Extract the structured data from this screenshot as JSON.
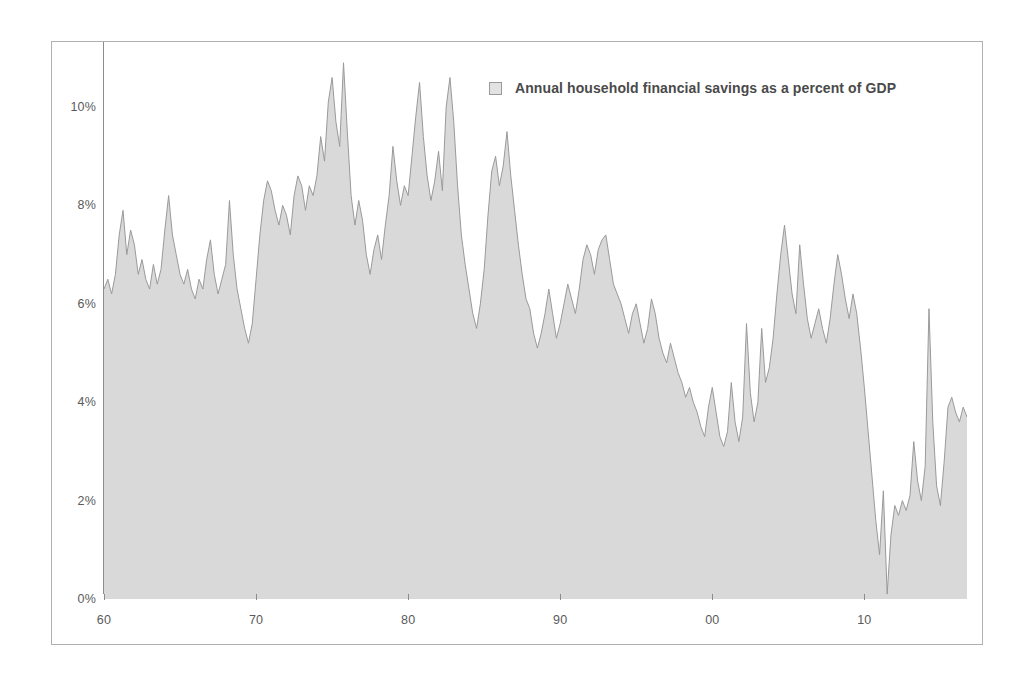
{
  "chart_data": {
    "type": "area",
    "title": "",
    "subtitle": "",
    "xlabel": "",
    "ylabel": "",
    "xlim": [
      1960,
      2016.75
    ],
    "ylim": [
      0,
      11.2
    ],
    "grid": false,
    "legend_position": "top-center-right",
    "legend": [
      {
        "name": "Annual household financial savings as a percent of GDP",
        "swatch_color": "#e2e2e2",
        "line_color": "#9a9a9a"
      }
    ],
    "y_ticks": [
      {
        "value": 0,
        "label": "0%"
      },
      {
        "value": 2,
        "label": "2%"
      },
      {
        "value": 4,
        "label": "4%"
      },
      {
        "value": 6,
        "label": "6%"
      },
      {
        "value": 8,
        "label": "8%"
      },
      {
        "value": 10,
        "label": "10%"
      }
    ],
    "x_ticks": [
      {
        "value": 1960,
        "label": "60"
      },
      {
        "value": 1970,
        "label": "70"
      },
      {
        "value": 1980,
        "label": "80"
      },
      {
        "value": 1990,
        "label": "90"
      },
      {
        "value": 2000,
        "label": "00"
      },
      {
        "value": 2010,
        "label": "10"
      }
    ],
    "series": [
      {
        "name": "Annual household financial savings as a percent of GDP",
        "x_start": 1960.0,
        "x_step": 0.25,
        "unit": "percent of GDP",
        "values": [
          6.3,
          6.5,
          6.2,
          6.6,
          7.4,
          7.9,
          7.0,
          7.5,
          7.2,
          6.6,
          6.9,
          6.5,
          6.3,
          6.8,
          6.4,
          6.7,
          7.5,
          8.2,
          7.4,
          7.0,
          6.6,
          6.4,
          6.7,
          6.3,
          6.1,
          6.5,
          6.3,
          6.9,
          7.3,
          6.6,
          6.2,
          6.5,
          6.8,
          8.1,
          7.0,
          6.3,
          5.9,
          5.5,
          5.2,
          5.6,
          6.5,
          7.4,
          8.1,
          8.5,
          8.3,
          7.9,
          7.6,
          8.0,
          7.8,
          7.4,
          8.2,
          8.6,
          8.4,
          7.9,
          8.4,
          8.2,
          8.6,
          9.4,
          8.9,
          10.1,
          10.6,
          9.7,
          9.2,
          10.9,
          9.5,
          8.2,
          7.6,
          8.1,
          7.7,
          7.0,
          6.6,
          7.1,
          7.4,
          6.9,
          7.6,
          8.2,
          9.2,
          8.5,
          8.0,
          8.4,
          8.2,
          9.0,
          9.8,
          10.5,
          9.4,
          8.6,
          8.1,
          8.5,
          9.1,
          8.3,
          10.0,
          10.6,
          9.7,
          8.4,
          7.4,
          6.8,
          6.3,
          5.8,
          5.5,
          6.0,
          6.7,
          7.8,
          8.7,
          9.0,
          8.4,
          8.8,
          9.5,
          8.6,
          7.9,
          7.2,
          6.6,
          6.1,
          5.9,
          5.4,
          5.1,
          5.4,
          5.8,
          6.3,
          5.8,
          5.3,
          5.6,
          6.0,
          6.4,
          6.1,
          5.8,
          6.3,
          6.9,
          7.2,
          7.0,
          6.6,
          7.1,
          7.3,
          7.4,
          6.9,
          6.4,
          6.2,
          6.0,
          5.7,
          5.4,
          5.8,
          6.0,
          5.6,
          5.2,
          5.5,
          6.1,
          5.8,
          5.3,
          5.0,
          4.8,
          5.2,
          4.9,
          4.6,
          4.4,
          4.1,
          4.3,
          4.0,
          3.8,
          3.5,
          3.3,
          3.9,
          4.3,
          3.8,
          3.3,
          3.1,
          3.4,
          4.4,
          3.6,
          3.2,
          3.7,
          5.6,
          4.2,
          3.6,
          4.0,
          5.5,
          4.4,
          4.7,
          5.3,
          6.2,
          7.0,
          7.6,
          6.9,
          6.2,
          5.8,
          7.2,
          6.4,
          5.7,
          5.3,
          5.6,
          5.9,
          5.5,
          5.2,
          5.7,
          6.4,
          7.0,
          6.6,
          6.1,
          5.7,
          6.2,
          5.8,
          5.1,
          4.3,
          3.4,
          2.5,
          1.6,
          0.9,
          2.2,
          0.1,
          1.3,
          1.9,
          1.7,
          2.0,
          1.8,
          2.1,
          3.2,
          2.4,
          2.0,
          2.7,
          5.9,
          3.6,
          2.3,
          1.9,
          2.8,
          3.9,
          4.1,
          3.8,
          3.6,
          3.9,
          3.7,
          4.1,
          3.9,
          3.4
        ]
      }
    ]
  }
}
